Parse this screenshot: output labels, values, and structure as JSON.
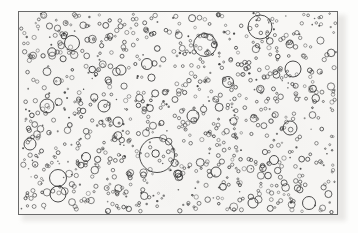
{
  "figure": {
    "domain": "diagram",
    "kind": "random-disc-distribution-plate",
    "background_color": "#f8f7f5",
    "page_color": "#fdfdfc",
    "frame_color": "#6a6a6a",
    "circle_stroke_color": "#3a3a3a",
    "frame": {
      "x": 18,
      "y": 11,
      "width": 320,
      "height": 204,
      "border_width": 1
    },
    "counts": {
      "total_circles": 980,
      "large_circles": 22,
      "medium_circles": 150,
      "small_circles": 808
    },
    "size_range": {
      "min_radius": 0.7,
      "max_radius": 17.5,
      "unit": "px"
    },
    "large_circles": [
      {
        "cx": 72,
        "cy": 43,
        "r": 7.5
      },
      {
        "cx": 52,
        "cy": 52,
        "r": 4.2
      },
      {
        "cx": 205,
        "cy": 45,
        "r": 11.5
      },
      {
        "cx": 260,
        "cy": 27,
        "r": 12.0
      },
      {
        "cx": 293,
        "cy": 69,
        "r": 8.0
      },
      {
        "cx": 290,
        "cy": 128,
        "r": 7.0
      },
      {
        "cx": 157,
        "cy": 155,
        "r": 17.5
      },
      {
        "cx": 58,
        "cy": 178,
        "r": 8.5
      },
      {
        "cx": 58,
        "cy": 194,
        "r": 8.0
      },
      {
        "cx": 47,
        "cy": 106,
        "r": 7.0
      },
      {
        "cx": 104,
        "cy": 106,
        "r": 6.0
      },
      {
        "cx": 118,
        "cy": 122,
        "r": 5.0
      },
      {
        "cx": 193,
        "cy": 116,
        "r": 6.0
      },
      {
        "cx": 309,
        "cy": 203,
        "r": 6.5
      },
      {
        "cx": 253,
        "cy": 203,
        "r": 5.0
      },
      {
        "cx": 30,
        "cy": 144,
        "r": 6.0
      },
      {
        "cx": 228,
        "cy": 82,
        "r": 5.5
      },
      {
        "cx": 147,
        "cy": 64,
        "r": 5.5
      },
      {
        "cx": 121,
        "cy": 70,
        "r": 5.0
      },
      {
        "cx": 86,
        "cy": 157,
        "r": 4.5
      },
      {
        "cx": 216,
        "cy": 172,
        "r": 5.0
      },
      {
        "cx": 274,
        "cy": 160,
        "r": 4.5
      }
    ],
    "generation": {
      "random_seed": 20250607,
      "small_count": 808,
      "medium_count": 150,
      "small_radius_min": 0.7,
      "small_radius_max": 2.2,
      "medium_radius_min": 2.2,
      "medium_radius_max": 4.0
    }
  }
}
